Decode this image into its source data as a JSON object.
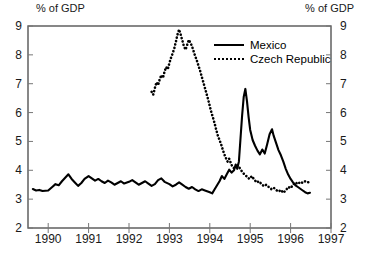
{
  "chart_data": {
    "type": "line",
    "title": "",
    "ylabel_left": "% of GDP",
    "ylabel_right": "% of GDP",
    "xlabel": "",
    "ylim": [
      2,
      9
    ],
    "xlim": [
      1989.5,
      1997.0
    ],
    "yticks": [
      2,
      3,
      4,
      5,
      6,
      7,
      8,
      9
    ],
    "xticks": [
      1990,
      1991,
      1992,
      1993,
      1994,
      1995,
      1996,
      1997
    ],
    "grid": false,
    "legend_position": "top-right",
    "series": [
      {
        "name": "Mexico",
        "style": "solid",
        "color": "#000000",
        "points": [
          [
            1989.62,
            3.35
          ],
          [
            1989.7,
            3.3
          ],
          [
            1989.78,
            3.32
          ],
          [
            1989.86,
            3.28
          ],
          [
            1990.0,
            3.3
          ],
          [
            1990.1,
            3.42
          ],
          [
            1990.18,
            3.52
          ],
          [
            1990.26,
            3.48
          ],
          [
            1990.34,
            3.62
          ],
          [
            1990.42,
            3.74
          ],
          [
            1990.5,
            3.86
          ],
          [
            1990.58,
            3.7
          ],
          [
            1990.66,
            3.58
          ],
          [
            1990.74,
            3.46
          ],
          [
            1990.82,
            3.56
          ],
          [
            1990.9,
            3.7
          ],
          [
            1991.0,
            3.8
          ],
          [
            1991.08,
            3.72
          ],
          [
            1991.16,
            3.64
          ],
          [
            1991.24,
            3.7
          ],
          [
            1991.32,
            3.62
          ],
          [
            1991.4,
            3.56
          ],
          [
            1991.48,
            3.64
          ],
          [
            1991.56,
            3.58
          ],
          [
            1991.64,
            3.5
          ],
          [
            1991.72,
            3.56
          ],
          [
            1991.8,
            3.62
          ],
          [
            1991.88,
            3.54
          ],
          [
            1992.0,
            3.6
          ],
          [
            1992.08,
            3.66
          ],
          [
            1992.16,
            3.58
          ],
          [
            1992.24,
            3.5
          ],
          [
            1992.32,
            3.56
          ],
          [
            1992.4,
            3.62
          ],
          [
            1992.48,
            3.54
          ],
          [
            1992.56,
            3.46
          ],
          [
            1992.64,
            3.52
          ],
          [
            1992.72,
            3.66
          ],
          [
            1992.8,
            3.72
          ],
          [
            1992.88,
            3.6
          ],
          [
            1993.0,
            3.52
          ],
          [
            1993.08,
            3.44
          ],
          [
            1993.16,
            3.5
          ],
          [
            1993.24,
            3.58
          ],
          [
            1993.32,
            3.5
          ],
          [
            1993.4,
            3.42
          ],
          [
            1993.48,
            3.36
          ],
          [
            1993.56,
            3.42
          ],
          [
            1993.64,
            3.34
          ],
          [
            1993.72,
            3.28
          ],
          [
            1993.8,
            3.34
          ],
          [
            1993.88,
            3.3
          ],
          [
            1994.0,
            3.24
          ],
          [
            1994.06,
            3.2
          ],
          [
            1994.12,
            3.34
          ],
          [
            1994.18,
            3.48
          ],
          [
            1994.24,
            3.62
          ],
          [
            1994.3,
            3.8
          ],
          [
            1994.36,
            3.7
          ],
          [
            1994.42,
            3.86
          ],
          [
            1994.48,
            4.02
          ],
          [
            1994.54,
            3.92
          ],
          [
            1994.6,
            4.0
          ],
          [
            1994.64,
            4.2
          ],
          [
            1994.68,
            4.05
          ],
          [
            1994.72,
            4.3
          ],
          [
            1994.76,
            5.1
          ],
          [
            1994.8,
            5.9
          ],
          [
            1994.84,
            6.55
          ],
          [
            1994.88,
            6.82
          ],
          [
            1994.92,
            6.4
          ],
          [
            1994.96,
            5.85
          ],
          [
            1995.0,
            5.4
          ],
          [
            1995.06,
            5.05
          ],
          [
            1995.12,
            4.85
          ],
          [
            1995.18,
            4.68
          ],
          [
            1995.24,
            4.55
          ],
          [
            1995.3,
            4.72
          ],
          [
            1995.36,
            4.58
          ],
          [
            1995.42,
            4.9
          ],
          [
            1995.48,
            5.25
          ],
          [
            1995.54,
            5.42
          ],
          [
            1995.58,
            5.2
          ],
          [
            1995.64,
            4.95
          ],
          [
            1995.7,
            4.7
          ],
          [
            1995.76,
            4.52
          ],
          [
            1995.82,
            4.3
          ],
          [
            1995.88,
            4.05
          ],
          [
            1995.94,
            3.85
          ],
          [
            1996.0,
            3.7
          ],
          [
            1996.06,
            3.58
          ],
          [
            1996.12,
            3.48
          ],
          [
            1996.18,
            3.42
          ],
          [
            1996.24,
            3.36
          ],
          [
            1996.3,
            3.3
          ],
          [
            1996.36,
            3.24
          ],
          [
            1996.42,
            3.2
          ],
          [
            1996.48,
            3.22
          ]
        ]
      },
      {
        "name": "Czech Republic",
        "style": "dotted",
        "color": "#000000",
        "points": [
          [
            1992.56,
            6.72
          ],
          [
            1992.6,
            6.62
          ],
          [
            1992.64,
            6.85
          ],
          [
            1992.68,
            7.05
          ],
          [
            1992.72,
            6.95
          ],
          [
            1992.76,
            7.15
          ],
          [
            1992.8,
            7.3
          ],
          [
            1992.84,
            7.2
          ],
          [
            1992.88,
            7.42
          ],
          [
            1992.92,
            7.58
          ],
          [
            1992.96,
            7.5
          ],
          [
            1993.0,
            7.72
          ],
          [
            1993.04,
            7.9
          ],
          [
            1993.08,
            8.05
          ],
          [
            1993.12,
            8.22
          ],
          [
            1993.16,
            8.45
          ],
          [
            1993.2,
            8.7
          ],
          [
            1993.24,
            8.88
          ],
          [
            1993.28,
            8.7
          ],
          [
            1993.32,
            8.5
          ],
          [
            1993.36,
            8.3
          ],
          [
            1993.4,
            8.18
          ],
          [
            1993.44,
            8.35
          ],
          [
            1993.48,
            8.52
          ],
          [
            1993.52,
            8.42
          ],
          [
            1993.56,
            8.3
          ],
          [
            1993.6,
            8.12
          ],
          [
            1993.64,
            7.95
          ],
          [
            1993.68,
            7.8
          ],
          [
            1993.72,
            7.62
          ],
          [
            1993.76,
            7.45
          ],
          [
            1993.8,
            7.25
          ],
          [
            1993.84,
            7.05
          ],
          [
            1993.88,
            6.85
          ],
          [
            1993.92,
            6.65
          ],
          [
            1993.96,
            6.45
          ],
          [
            1994.0,
            6.22
          ],
          [
            1994.04,
            6.0
          ],
          [
            1994.08,
            5.82
          ],
          [
            1994.12,
            5.62
          ],
          [
            1994.16,
            5.4
          ],
          [
            1994.2,
            5.2
          ],
          [
            1994.24,
            5.05
          ],
          [
            1994.28,
            4.9
          ],
          [
            1994.32,
            4.72
          ],
          [
            1994.36,
            4.55
          ],
          [
            1994.4,
            4.42
          ],
          [
            1994.44,
            4.3
          ],
          [
            1994.48,
            4.4
          ],
          [
            1994.52,
            4.25
          ],
          [
            1994.56,
            4.12
          ],
          [
            1994.62,
            4.05
          ],
          [
            1994.68,
            4.2
          ],
          [
            1994.74,
            4.08
          ],
          [
            1994.8,
            3.95
          ],
          [
            1994.86,
            3.85
          ],
          [
            1994.92,
            3.78
          ],
          [
            1994.98,
            3.7
          ],
          [
            1995.04,
            3.8
          ],
          [
            1995.1,
            3.68
          ],
          [
            1995.16,
            3.58
          ],
          [
            1995.22,
            3.62
          ],
          [
            1995.28,
            3.52
          ],
          [
            1995.34,
            3.45
          ],
          [
            1995.4,
            3.5
          ],
          [
            1995.46,
            3.42
          ],
          [
            1995.52,
            3.35
          ],
          [
            1995.58,
            3.4
          ],
          [
            1995.64,
            3.32
          ],
          [
            1995.7,
            3.26
          ],
          [
            1995.76,
            3.32
          ],
          [
            1995.82,
            3.22
          ],
          [
            1995.88,
            3.3
          ],
          [
            1995.94,
            3.42
          ],
          [
            1996.0,
            3.38
          ],
          [
            1996.06,
            3.5
          ],
          [
            1996.12,
            3.58
          ],
          [
            1996.18,
            3.52
          ],
          [
            1996.24,
            3.6
          ],
          [
            1996.3,
            3.56
          ],
          [
            1996.36,
            3.62
          ],
          [
            1996.42,
            3.58
          ],
          [
            1996.48,
            3.6
          ]
        ]
      }
    ]
  },
  "legend": {
    "items": [
      {
        "label": "Mexico",
        "style": "solid"
      },
      {
        "label": "Czech Republic",
        "style": "dotted"
      }
    ]
  }
}
